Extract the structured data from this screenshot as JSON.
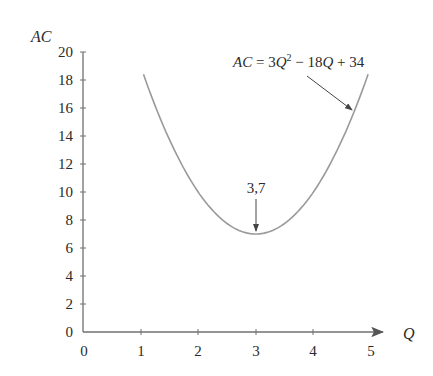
{
  "chart_data": {
    "type": "line",
    "title": "",
    "xlabel": "Q",
    "ylabel": "AC",
    "xlim": [
      0,
      5
    ],
    "ylim": [
      0,
      20
    ],
    "xticks": [
      0,
      1,
      2,
      3,
      4,
      5
    ],
    "yticks": [
      0,
      2,
      4,
      6,
      8,
      10,
      12,
      14,
      16,
      18,
      20
    ],
    "grid": false,
    "legend": null,
    "series": [
      {
        "name": "AC = 3Q² − 18Q + 34",
        "function": "3Q^2 - 18Q + 34",
        "x_range": [
          1.05,
          4.95
        ],
        "x": [
          1.05,
          1.5,
          2.0,
          2.5,
          3.0,
          3.5,
          4.0,
          4.5,
          4.95
        ],
        "values": [
          18.4,
          13.75,
          10,
          7.75,
          7,
          7.75,
          10,
          13.75,
          18.4
        ],
        "color": "#9a9a9a"
      }
    ],
    "annotations": [
      {
        "text": "AC = 3Q² − 18Q + 34",
        "type": "arrow-label",
        "points_to": [
          4.72,
          15.9
        ]
      },
      {
        "text": "3,7",
        "type": "arrow-label",
        "points_to": [
          3,
          7
        ]
      }
    ]
  },
  "labels": {
    "y_axis_title": "AC",
    "x_axis_title": "Q",
    "formula_parts": {
      "ac": "AC",
      "eq": " = 3",
      "q1": "Q",
      "sup": "2",
      "mid": " − 18",
      "q2": "Q",
      "tail": " + 34"
    },
    "min_point": "3,7"
  },
  "colors": {
    "axis": "#707070",
    "curve": "#9a9a9a",
    "text": "#2a2a2a",
    "arrow": "#444444"
  }
}
